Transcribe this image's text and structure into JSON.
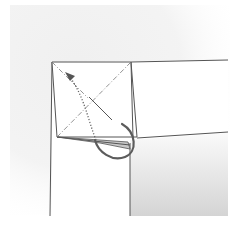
{
  "diagram": {
    "colors": {
      "background": "#ffffff",
      "texture": "#ececec",
      "line": "#5a5a5a",
      "arrow": "#666666",
      "shade_light": "#f6f6f6",
      "shade_dark": "#d2d2d2",
      "flap_fill": "#c9c9c9"
    },
    "elements": [
      {
        "name": "square-flap",
        "type": "polygon"
      },
      {
        "name": "diagonal-crease-valley",
        "type": "dash-dot line"
      },
      {
        "name": "diagonal-crease-mountain",
        "type": "solid line"
      },
      {
        "name": "fold-arrow",
        "type": "dotted curved arrow"
      },
      {
        "name": "tuck-arrow",
        "type": "curved arrow"
      },
      {
        "name": "right-strip",
        "type": "paper edge"
      },
      {
        "name": "shaded-region",
        "type": "gradient fill"
      }
    ]
  }
}
